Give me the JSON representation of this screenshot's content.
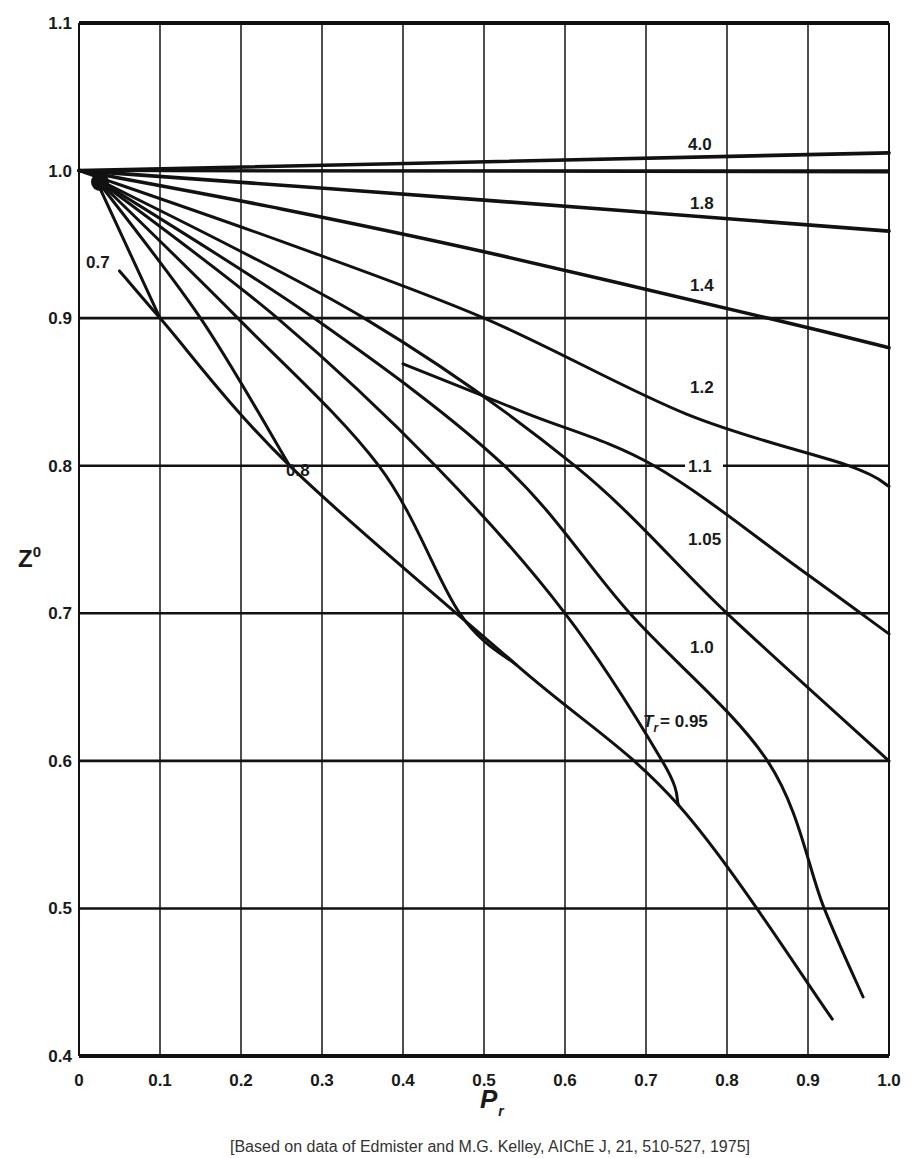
{
  "chart_data": {
    "type": "line",
    "title": "",
    "xlabel": "P_r",
    "ylabel": "Z^0",
    "xlim": [
      0,
      1.0
    ],
    "ylim": [
      0.4,
      1.1
    ],
    "grid": true,
    "x_ticks": [
      "0",
      "0.1",
      "0.2",
      "0.3",
      "0.4",
      "0.5",
      "0.6",
      "0.7",
      "0.8",
      "0.9",
      "1.0"
    ],
    "y_ticks": [
      "0.4",
      "0.5",
      "0.6",
      "0.7",
      "0.8",
      "0.9",
      "1.0",
      "1.1"
    ],
    "legend": "none (curves labeled inline)",
    "series": [
      {
        "name": "4.0",
        "label": "4.0",
        "x": [
          0.0,
          1.0
        ],
        "y": [
          1.0,
          1.012
        ]
      },
      {
        "name": "1.8",
        "label": "1.8",
        "x": [
          0.0,
          0.5,
          1.0
        ],
        "y": [
          1.0,
          0.98,
          0.959
        ]
      },
      {
        "name": "1.4",
        "label": "1.4",
        "x": [
          0.0,
          0.25,
          0.5,
          0.85,
          1.0
        ],
        "y": [
          1.0,
          0.974,
          0.945,
          0.9,
          0.88
        ]
      },
      {
        "name": "1.2",
        "label": "1.2",
        "x": [
          0.0,
          0.25,
          0.5,
          0.75,
          0.95,
          1.0
        ],
        "y": [
          1.0,
          0.952,
          0.9,
          0.835,
          0.8,
          0.786
        ]
      },
      {
        "name": "1.1",
        "label": "1.1",
        "x": [
          0.4,
          0.55,
          0.71,
          0.89,
          1.0
        ],
        "y": [
          0.869,
          0.836,
          0.8,
          0.73,
          0.686
        ]
      },
      {
        "name": "1.05",
        "label": "1.05",
        "x": [
          0.02,
          0.352,
          0.612,
          0.8,
          1.0
        ],
        "y": [
          0.995,
          0.9,
          0.8,
          0.7,
          0.6
        ]
      },
      {
        "name": "1.0",
        "label": "1.0",
        "x": [
          0.02,
          0.29,
          0.525,
          0.68,
          0.85,
          0.92,
          0.968
        ],
        "y": [
          0.995,
          0.9,
          0.8,
          0.7,
          0.6,
          0.5,
          0.44
        ]
      },
      {
        "name": "0.95",
        "label": "T_r = 0.95",
        "x": [
          0.02,
          0.245,
          0.44,
          0.6,
          0.72,
          0.74
        ],
        "y": [
          0.995,
          0.9,
          0.8,
          0.7,
          0.6,
          0.57
        ]
      },
      {
        "name": "0.9",
        "label": "",
        "x": [
          0.02,
          0.196,
          0.37,
          0.47,
          0.54
        ],
        "y": [
          0.995,
          0.9,
          0.8,
          0.7,
          0.665
        ]
      },
      {
        "name": "0.8",
        "label": "0.8",
        "x": [
          0.02,
          0.15,
          0.26
        ],
        "y": [
          0.995,
          0.9,
          0.8
        ]
      },
      {
        "name": "0.7",
        "label": "0.7",
        "x": [
          0.02,
          0.1
        ],
        "y": [
          0.995,
          0.9
        ]
      },
      {
        "name": "saturated-vapor",
        "label": "",
        "x": [
          0.05,
          0.1,
          0.26,
          0.54,
          0.74,
          0.93
        ],
        "y": [
          0.932,
          0.9,
          0.8,
          0.665,
          0.57,
          0.425
        ]
      }
    ],
    "annotations": [
      "4.0",
      "1.8",
      "1.4",
      "1.2",
      "1.1",
      "1.05",
      "1.0",
      "T_r = 0.95",
      "0.8",
      "0.7"
    ],
    "caption": "[Based on data of Edmister and M.G. Kelley, AIChE J, 21, 510-527, 1975]"
  },
  "labels": {
    "y_axis_title": "Z",
    "y_axis_sup": "0",
    "x_axis_title": "P",
    "x_axis_sub": "r",
    "caption": "[Based on data of Edmister and M.G. Kelley, AIChE J, 21, 510-527, 1975]",
    "label_40": "4.0",
    "label_18": "1.8",
    "label_14": "1.4",
    "label_12": "1.2",
    "label_11": "1.1",
    "label_105": "1.05",
    "label_10": "1.0",
    "label_095_T": "T",
    "label_095_r": "r",
    "label_095_val": "= 0.95",
    "label_08": "0.8",
    "label_07": "0.7"
  }
}
